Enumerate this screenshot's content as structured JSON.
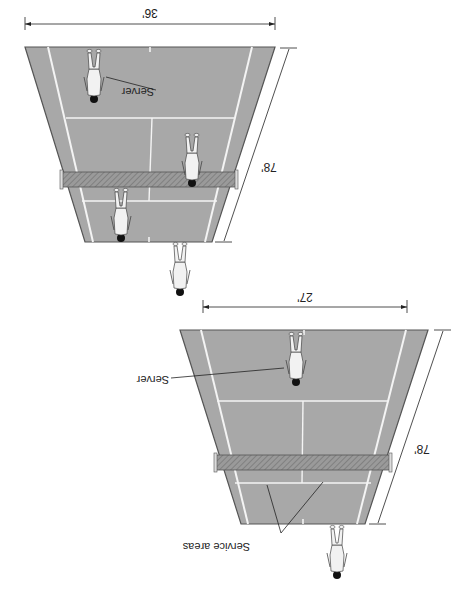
{
  "diagram": {
    "orientation": "rotated-180",
    "colors": {
      "court": "#a8a8a8",
      "alley": "#b4b4b4",
      "line": "#f4f4f4",
      "outline": "#555555",
      "net": "#8c8c8c",
      "ink": "#222222",
      "player": "#f2f2f2",
      "hair": "#111111"
    },
    "courts": [
      {
        "id": "doubles",
        "width_label": "36'",
        "length_label": "78'",
        "annotations": [
          {
            "label": "Server"
          }
        ],
        "players": 4
      },
      {
        "id": "singles",
        "width_label": "27'",
        "length_label": "78'",
        "annotations": [
          {
            "label": "Server"
          },
          {
            "label": "Service areas"
          }
        ],
        "players": 2
      }
    ]
  }
}
